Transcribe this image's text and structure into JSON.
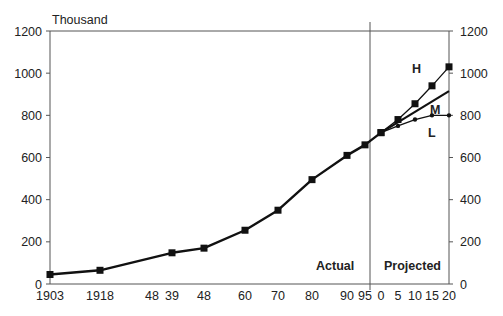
{
  "chart_data": {
    "type": "line",
    "title": "",
    "ylabel": "Thousand",
    "xlabel": "",
    "ylim": [
      0,
      1200
    ],
    "yticks": [
      0,
      200,
      400,
      600,
      800,
      1000,
      1200
    ],
    "grid": false,
    "right_axis": true,
    "x_tick_labels": [
      "1903",
      "1918",
      "48",
      "39",
      "48",
      "60",
      "70",
      "80",
      "90",
      "95",
      "0",
      "5",
      "10",
      "15",
      "20"
    ],
    "regions": [
      {
        "label": "Actual",
        "from": "1903",
        "to": "1995"
      },
      {
        "label": "Projected",
        "from": "2000",
        "to": "2020"
      }
    ],
    "series": [
      {
        "name": "Actual",
        "marker": "square",
        "x": [
          "1903",
          "1918",
          "1939",
          "1948",
          "1960",
          "1970",
          "1980",
          "1990",
          "1995",
          "2000"
        ],
        "values": [
          45,
          65,
          148,
          170,
          255,
          350,
          495,
          610,
          660,
          718
        ]
      },
      {
        "name": "H",
        "marker": "square",
        "x": [
          "2000",
          "2005",
          "2010",
          "2015",
          "2020"
        ],
        "values": [
          718,
          780,
          855,
          940,
          1030
        ]
      },
      {
        "name": "M",
        "marker": "none",
        "x": [
          "2000",
          "2020"
        ],
        "values": [
          718,
          915
        ]
      },
      {
        "name": "L",
        "marker": "dot",
        "x": [
          "2000",
          "2005",
          "2010",
          "2015",
          "2020"
        ],
        "values": [
          718,
          750,
          780,
          800,
          800
        ]
      }
    ]
  },
  "labels": {
    "unit": "Thousand",
    "actual": "Actual",
    "projected": "Projected",
    "H": "H",
    "M": "M",
    "L": "L"
  },
  "layout": {
    "plot_left": 50,
    "plot_right": 449,
    "plot_top": 31,
    "plot_bottom": 284,
    "divider_x": 370,
    "x_positions": [
      50,
      100,
      152,
      172,
      204,
      245,
      278,
      312,
      347,
      365,
      381,
      398,
      415,
      432,
      449
    ],
    "line_color": "#111111",
    "axis_color": "#555555"
  }
}
